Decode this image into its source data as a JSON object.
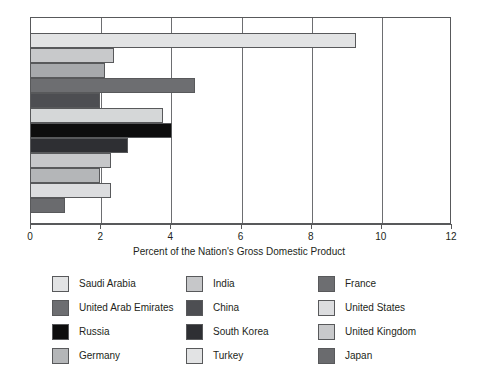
{
  "chart_data": {
    "type": "bar",
    "orientation": "horizontal",
    "title": "",
    "xlabel": "Percent of the Nation's Gross Domestic Product",
    "ylabel": "",
    "xlim": [
      0,
      12
    ],
    "xticks": [
      0,
      2,
      4,
      6,
      8,
      10,
      12
    ],
    "xtick_labels": [
      "0",
      "2",
      "4",
      "6",
      "8",
      "10",
      "12"
    ],
    "grid": true,
    "grid_axis": "x",
    "legend_position": "bottom",
    "legend_columns": 3,
    "categories": [
      "Saudi Arabia",
      "United Arab Emirates",
      "Russia",
      "France",
      "Germany",
      "India",
      "China",
      "South Korea",
      "Turkey",
      "United States",
      "United Kingdom",
      "Japan"
    ],
    "values": [
      9.3,
      2.4,
      2.15,
      4.7,
      2.0,
      3.8,
      4.05,
      2.8,
      2.3,
      2.0,
      2.3,
      1.0
    ],
    "colors": [
      "#e2e3e4",
      "#c8c9cb",
      "#a7a9ac",
      "#6d6e71",
      "#4d4e52",
      "#d5d7d8",
      "#0d0d0d",
      "#2e2f33",
      "#c6c7c9",
      "#b4b6b8",
      "#dcdddf",
      "#6a6b6e"
    ],
    "bars": [
      {
        "label": "Saudi Arabia",
        "value": 9.3,
        "color": "#e2e3e4"
      },
      {
        "label": "United Arab Emirates",
        "value": 2.4,
        "color": "#c8c9cb"
      },
      {
        "label": "Russia",
        "value": 2.15,
        "color": "#a7a9ac"
      },
      {
        "label": "France",
        "value": 4.7,
        "color": "#6d6e71"
      },
      {
        "label": "Germany",
        "value": 2.0,
        "color": "#4d4e52"
      },
      {
        "label": "India",
        "value": 3.8,
        "color": "#d5d7d8"
      },
      {
        "label": "China",
        "value": 4.05,
        "color": "#0d0d0d"
      },
      {
        "label": "South Korea",
        "value": 2.8,
        "color": "#2e2f33"
      },
      {
        "label": "Turkey",
        "value": 2.3,
        "color": "#c6c7c9"
      },
      {
        "label": "United States",
        "value": 2.0,
        "color": "#b4b6b8"
      },
      {
        "label": "United Kingdom",
        "value": 2.3,
        "color": "#dcdddf"
      },
      {
        "label": "Japan",
        "value": 1.0,
        "color": "#6a6b6e"
      }
    ]
  },
  "legend": {
    "columns": [
      {
        "items": [
          {
            "label": "Saudi Arabia",
            "color": "#e2e3e4"
          },
          {
            "label": "United Arab Emirates",
            "color": "#6d6e71"
          },
          {
            "label": "Russia",
            "color": "#0d0d0d"
          },
          {
            "label": "Germany",
            "color": "#b4b6b8"
          }
        ]
      },
      {
        "items": [
          {
            "label": "India",
            "color": "#c6c7c9"
          },
          {
            "label": "China",
            "color": "#4d4e52"
          },
          {
            "label": "South Korea",
            "color": "#2e2f33"
          },
          {
            "label": "Turkey",
            "color": "#e2e3e4"
          }
        ]
      },
      {
        "items": [
          {
            "label": "France",
            "color": "#6d6e71"
          },
          {
            "label": "United States",
            "color": "#dcdddf"
          },
          {
            "label": "United Kingdom",
            "color": "#c8c9cb"
          },
          {
            "label": "Japan",
            "color": "#6a6b6e"
          }
        ]
      }
    ]
  },
  "axis": {
    "title": "Percent of the Nation's Gross Domestic Product",
    "tick_labels": [
      "0",
      "2",
      "4",
      "6",
      "8",
      "10",
      "12"
    ]
  }
}
